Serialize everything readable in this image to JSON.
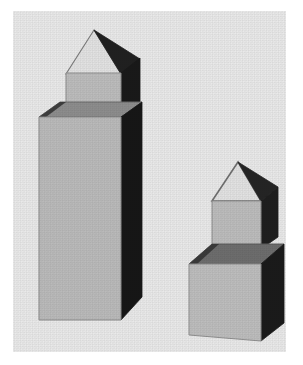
{
  "image": {
    "title": "Grayscale 3D block scene",
    "width": 303,
    "height": 365,
    "style": "halftone-noise monochrome render",
    "margin_color": "#ffffff"
  },
  "panel": {
    "name": "image-panel",
    "x": 13,
    "y": 11,
    "width": 273,
    "height": 341,
    "background_color": "#e9e9e9"
  },
  "palette": {
    "background": "#e9e9e9",
    "face_front_light": "#b9b9b9",
    "face_front_light2": "#bdbdbd",
    "face_top_mid": "#8f8f8f",
    "face_top_dark": "#6e6e6e",
    "face_side_dark": "#1c1c1c",
    "face_side_dark2": "#2a2a2a",
    "roof_light": "#dedede",
    "outline": "#5a5a5a",
    "outline_soft": "#8a8a8a"
  },
  "chart_data": {
    "type": "scatter",
    "categories": [
      "tall-tower",
      "short-tower"
    ],
    "values": [
      2,
      2
    ],
    "xlabel": "",
    "ylabel": ""
  },
  "objects": [
    {
      "id": "tall-tower",
      "label": "Tall tower structure",
      "parts": [
        {
          "id": "tall-base-box",
          "label": "Tall rectangular base box",
          "faces": [
            "front-light",
            "top-mid",
            "right-dark"
          ]
        },
        {
          "id": "tall-upper-cube",
          "label": "Upper cube",
          "faces": [
            "front-light",
            "right-dark"
          ]
        },
        {
          "id": "tall-roof",
          "label": "Pyramidal roof",
          "faces": [
            "left-light",
            "right-dark"
          ]
        }
      ],
      "approx_bounds": {
        "x": 38,
        "y": 29,
        "width": 104,
        "height": 294
      }
    },
    {
      "id": "short-tower",
      "label": "Short tower structure",
      "parts": [
        {
          "id": "short-base-box",
          "label": "Short base box",
          "faces": [
            "front-light",
            "top-dark",
            "right-dark"
          ]
        },
        {
          "id": "short-upper-cube",
          "label": "Upper cube",
          "faces": [
            "front-light",
            "right-dark"
          ]
        },
        {
          "id": "short-roof",
          "label": "Pyramidal roof",
          "faces": [
            "left-light",
            "right-dark"
          ]
        }
      ],
      "approx_bounds": {
        "x": 186,
        "y": 160,
        "width": 98,
        "height": 180
      }
    }
  ]
}
